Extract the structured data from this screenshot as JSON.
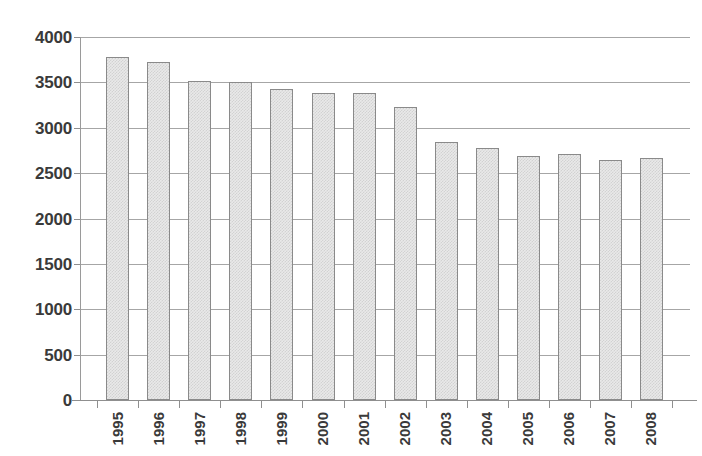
{
  "chart_data": {
    "type": "bar",
    "title": "",
    "subtitle": "",
    "xlabel": "",
    "ylabel": "",
    "categories": [
      "1995",
      "1996",
      "1997",
      "1998",
      "1999",
      "2000",
      "2001",
      "2002",
      "2003",
      "2004",
      "2005",
      "2006",
      "2007",
      "2008"
    ],
    "values": [
      3780,
      3720,
      3520,
      3500,
      3430,
      3380,
      3385,
      3230,
      2840,
      2780,
      2690,
      2715,
      2650,
      2670
    ],
    "series": [
      {
        "name": "",
        "values": [
          3780,
          3720,
          3520,
          3500,
          3430,
          3380,
          3385,
          3230,
          2840,
          2780,
          2690,
          2715,
          2650,
          2670
        ]
      }
    ],
    "ylim": [
      0,
      4000
    ],
    "yticks": [
      0,
      500,
      1000,
      1500,
      2000,
      2500,
      3000,
      3500,
      4000
    ],
    "ytick_labels": [
      "0",
      "500",
      "1000",
      "1500",
      "2000",
      "2500",
      "3000",
      "3500",
      "4000"
    ],
    "grid": true,
    "grid_axis": "y",
    "legend": false,
    "legend_position": "none",
    "annotations": [],
    "colors": {
      "bar_fill": "#e9e9e9",
      "bar_border": "#8a8a8a",
      "gridline": "#a6a6a6",
      "axis": "#8f8f8f",
      "tick_label": "#3a3a3a",
      "background": "#ffffff"
    }
  }
}
